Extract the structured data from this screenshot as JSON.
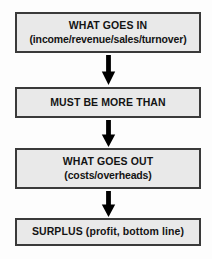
{
  "diagram": {
    "type": "flowchart",
    "orientation": "vertical",
    "colors": {
      "box_fill": "#e9e9e9",
      "box_border": "#3a3a3a",
      "text": "#141414",
      "arrow": "#000000",
      "background": "#fdfdfd"
    },
    "nodes": [
      {
        "id": "input",
        "line1": "WHAT GOES IN",
        "line2": "(income/revenue/sales/turnover)"
      },
      {
        "id": "rule",
        "line1": "MUST BE MORE THAN"
      },
      {
        "id": "output",
        "line1": "WHAT GOES OUT",
        "line2": "(costs/overheads)"
      },
      {
        "id": "result",
        "line1": "SURPLUS (profit, bottom line)"
      }
    ],
    "connectors": [
      {
        "id": "arrow-1",
        "from": "input",
        "to": "rule",
        "icon": "arrow-down-icon"
      },
      {
        "id": "arrow-2",
        "from": "rule",
        "to": "output",
        "icon": "arrow-down-icon"
      },
      {
        "id": "arrow-3",
        "from": "output",
        "to": "result",
        "icon": "arrow-down-icon"
      }
    ]
  }
}
